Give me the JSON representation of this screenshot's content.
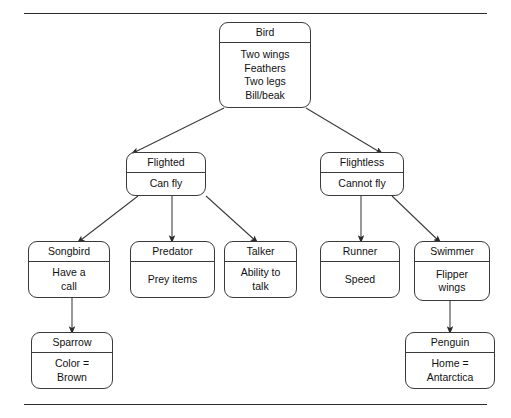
{
  "diagram": {
    "type": "tree",
    "line_color": "#3a3a3a",
    "background": "#ffffff",
    "rules": {
      "top": "horizontal-rule",
      "bottom": "horizontal-rule"
    },
    "nodes": [
      {
        "id": "bird",
        "title": "Bird",
        "attributes": [
          "Two wings",
          "Feathers",
          "Two legs",
          "Bill/beak"
        ],
        "level": 0
      },
      {
        "id": "flighted",
        "title": "Flighted",
        "attributes": [
          "Can fly"
        ],
        "level": 1
      },
      {
        "id": "flightless",
        "title": "Flightless",
        "attributes": [
          "Cannot fly"
        ],
        "level": 1
      },
      {
        "id": "songbird",
        "title": "Songbird",
        "attributes": [
          "Have a",
          "call"
        ],
        "level": 2
      },
      {
        "id": "predator",
        "title": "Predator",
        "attributes": [
          "Prey items"
        ],
        "level": 2
      },
      {
        "id": "talker",
        "title": "Talker",
        "attributes": [
          "Ability to",
          "talk"
        ],
        "level": 2
      },
      {
        "id": "runner",
        "title": "Runner",
        "attributes": [
          "Speed"
        ],
        "level": 2
      },
      {
        "id": "swimmer",
        "title": "Swimmer",
        "attributes": [
          "Flipper",
          "wings"
        ],
        "level": 2
      },
      {
        "id": "sparrow",
        "title": "Sparrow",
        "attributes": [
          "Color =",
          "Brown"
        ],
        "level": 3
      },
      {
        "id": "penguin",
        "title": "Penguin",
        "attributes": [
          "Home =",
          "Antarctica"
        ],
        "level": 3
      }
    ],
    "edges": [
      {
        "from": "bird",
        "to": "flighted"
      },
      {
        "from": "bird",
        "to": "flightless"
      },
      {
        "from": "flighted",
        "to": "songbird"
      },
      {
        "from": "flighted",
        "to": "predator"
      },
      {
        "from": "flighted",
        "to": "talker"
      },
      {
        "from": "flightless",
        "to": "runner"
      },
      {
        "from": "flightless",
        "to": "swimmer"
      },
      {
        "from": "songbird",
        "to": "sparrow"
      },
      {
        "from": "swimmer",
        "to": "penguin"
      }
    ]
  }
}
